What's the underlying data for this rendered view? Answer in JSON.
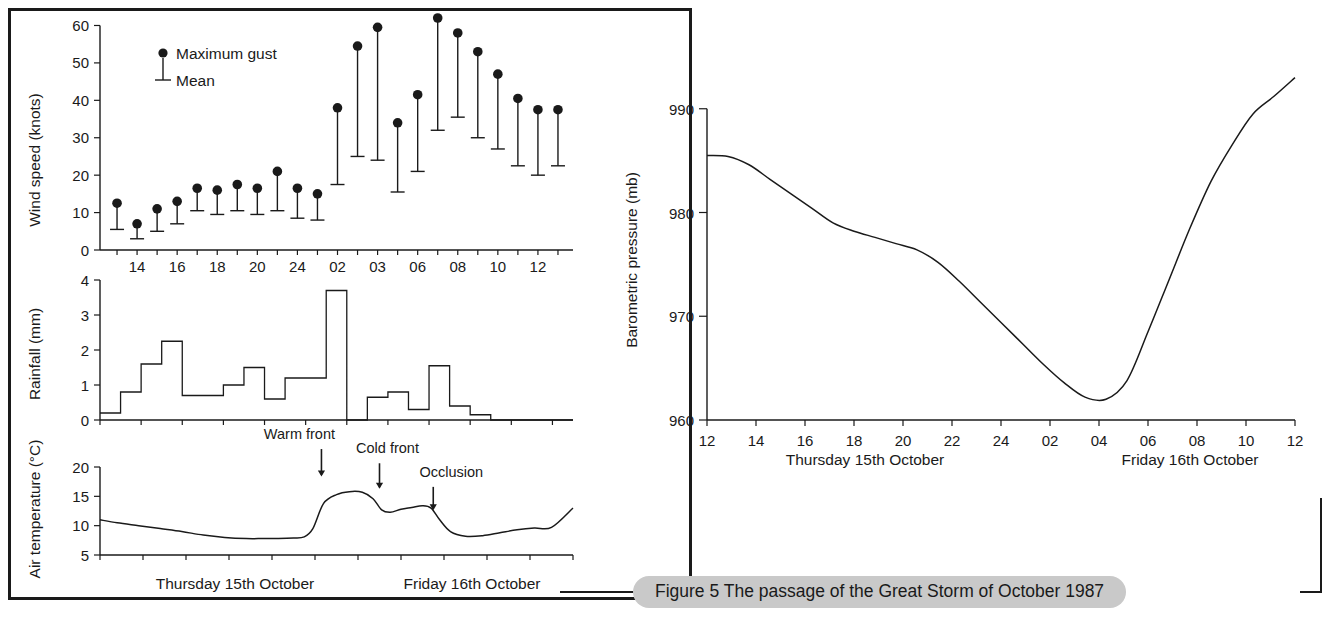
{
  "figure": {
    "caption": "Figure 5 The passage of the Great Storm of October 1987"
  },
  "panels": {
    "wind": {
      "ylabel": "Wind speed (knots)",
      "legend": {
        "gust": "Maximum gust",
        "mean": "Mean"
      }
    },
    "rain": {
      "ylabel": "Rainfall (mm)"
    },
    "temp": {
      "ylabel": "Air temperature (°C)",
      "annotations": {
        "warm": "Warm front",
        "cold": "Cold front",
        "occlusion": "Occlusion"
      },
      "day1": "Thursday 15th October",
      "day2": "Friday 16th October"
    },
    "pressure": {
      "ylabel": "Barometric pressure (mb)",
      "day1": "Thursday 15th October",
      "day2": "Friday 16th October"
    }
  },
  "chart_data": [
    {
      "type": "scatter",
      "id": "wind-speed",
      "title": "",
      "xlabel": "",
      "ylabel": "Wind speed (knots)",
      "ylim": [
        0,
        62
      ],
      "yticks": [
        0,
        10,
        20,
        30,
        40,
        50,
        60
      ],
      "ytick_labels": [
        "0",
        "10",
        "20",
        "30",
        "40",
        "50",
        "60"
      ],
      "grid": false,
      "legend": [
        "Maximum gust",
        "Mean"
      ],
      "legend_position": "inside-top-left",
      "xtick_labels": [
        "14",
        "16",
        "18",
        "20",
        "24",
        "02",
        "03",
        "06",
        "08",
        "10",
        "12",
        "14"
      ],
      "x": [
        0,
        1,
        2,
        3,
        4,
        5,
        6,
        7,
        8,
        9,
        10,
        11,
        12,
        13,
        14,
        15,
        16,
        17,
        18,
        19,
        20,
        21,
        22
      ],
      "series": [
        {
          "name": "Maximum gust",
          "values": [
            12.5,
            7,
            11,
            13,
            16.5,
            16,
            17.5,
            16.5,
            21,
            16.5,
            15,
            38,
            54.5,
            59.5,
            34,
            41.5,
            62,
            58,
            53,
            47,
            40.5,
            37.5,
            37.5
          ]
        },
        {
          "name": "Mean",
          "values": [
            5.5,
            3,
            5,
            7,
            10.5,
            9.5,
            10.5,
            9.5,
            10.5,
            8.5,
            8,
            17.5,
            25,
            24,
            15.5,
            21,
            32,
            35.5,
            30,
            27,
            22.5,
            20,
            22.5
          ]
        }
      ]
    },
    {
      "type": "area",
      "id": "rainfall",
      "title": "",
      "xlabel": "",
      "ylabel": "Rainfall (mm)",
      "ylim": [
        0,
        4
      ],
      "yticks": [
        0,
        1,
        2,
        3,
        4
      ],
      "ytick_labels": [
        "0",
        "1",
        "2",
        "3",
        "4"
      ],
      "grid": false,
      "step": true,
      "values": [
        0.2,
        0.8,
        1.6,
        2.25,
        0.7,
        0.7,
        1.0,
        1.5,
        0.6,
        1.2,
        1.2,
        3.7,
        0,
        0.65,
        0.8,
        0.3,
        1.55,
        0.4,
        0.15,
        0,
        0,
        0,
        0
      ]
    },
    {
      "type": "line",
      "id": "air-temperature",
      "title": "",
      "xlabel": "",
      "ylabel": "Air temperature (°C)",
      "ylim": [
        5,
        20
      ],
      "yticks": [
        5,
        10,
        15,
        20
      ],
      "ytick_labels": [
        "5",
        "10",
        "15",
        "20"
      ],
      "grid": false,
      "annotations": [
        {
          "label": "Warm front",
          "x": 10.3,
          "y": 15.9
        },
        {
          "label": "Cold front",
          "x": 13.0,
          "y": 14.5
        },
        {
          "label": "Occlusion",
          "x": 15.5,
          "y": 11.5
        }
      ],
      "x": [
        0,
        0.8,
        1.8,
        2.8,
        3.8,
        4.8,
        5.8,
        6.8,
        7.6,
        8.3,
        9.0,
        9.5,
        9.9,
        10.4,
        11.0,
        11.6,
        12.2,
        12.7,
        13.1,
        13.5,
        14.0,
        14.5,
        15.0,
        15.4,
        15.8,
        16.3,
        17.0,
        17.8,
        18.6,
        19.4,
        20.2,
        21.0,
        22.0
      ],
      "values": [
        11.0,
        10.5,
        10.0,
        9.5,
        9.0,
        8.4,
        8.0,
        7.8,
        7.8,
        7.8,
        7.9,
        8.1,
        9.5,
        13.8,
        15.3,
        15.8,
        15.7,
        14.6,
        12.7,
        12.3,
        12.8,
        13.1,
        13.4,
        13.0,
        11.0,
        9.0,
        8.2,
        8.3,
        8.8,
        9.3,
        9.6,
        9.7,
        13.0
      ]
    },
    {
      "type": "line",
      "id": "barometric-pressure",
      "title": "",
      "xlabel": "",
      "ylabel": "Barometric pressure (mb)",
      "ylim": [
        960,
        992
      ],
      "yticks": [
        960,
        970,
        980,
        990
      ],
      "ytick_labels": [
        "960",
        "970",
        "980",
        "990"
      ],
      "grid": false,
      "xtick_labels": [
        "12",
        "14",
        "16",
        "18",
        "20",
        "22",
        "24",
        "02",
        "04",
        "06",
        "08",
        "10",
        "12"
      ],
      "x": [
        12,
        13,
        14,
        15,
        16,
        17,
        18,
        19,
        20,
        21,
        22,
        23,
        24,
        25,
        26,
        27,
        28,
        29,
        30,
        31,
        32,
        33,
        34,
        35,
        36
      ],
      "values": [
        985.5,
        985.4,
        984.6,
        983.2,
        981.8,
        980.4,
        979.0,
        978.2,
        977.6,
        977.0,
        976.4,
        975.2,
        973.4,
        971.4,
        969.4,
        967.4,
        965.4,
        963.6,
        962.2,
        962.0,
        963.8,
        968.5,
        973.5,
        978.5,
        983.0
      ],
      "values_tail": [
        986.5,
        989.5,
        991.2,
        993.0
      ]
    }
  ]
}
